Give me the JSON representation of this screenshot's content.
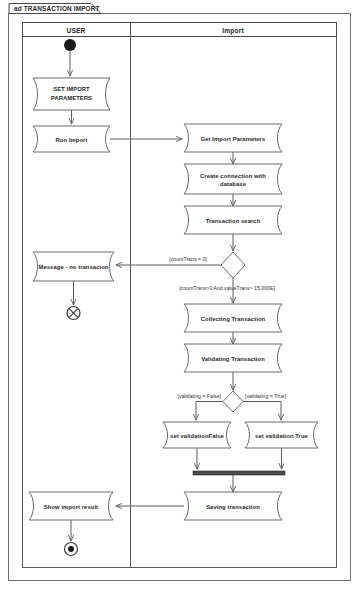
{
  "frame": {
    "title": "ad TRANSACTION IMPORT"
  },
  "lanes": [
    {
      "id": "user",
      "title": "USER"
    },
    {
      "id": "import",
      "title": "Import"
    }
  ],
  "nodes": {
    "initial": {
      "kind": "initial-node",
      "lane": "user"
    },
    "set_import_parameters": {
      "label": "SET IMPORT PARAMETERS",
      "line1": "SET IMPORT",
      "line2": "PARAMETERS",
      "lane": "user"
    },
    "run_import": {
      "label": "Run Import",
      "lane": "user"
    },
    "get_import_parameters": {
      "label": "Get Import Parameters",
      "lane": "import"
    },
    "create_connection": {
      "label": "Create connection with database",
      "line1": "Create connection with",
      "line2": "database",
      "lane": "import"
    },
    "transaction_search": {
      "label": "Transaction search",
      "lane": "import"
    },
    "decision_count": {
      "kind": "decision-node",
      "lane": "import"
    },
    "message_no_transaction": {
      "label": "Message - no transacion",
      "lane": "user"
    },
    "flow_final": {
      "kind": "flow-final-node",
      "lane": "user"
    },
    "collecting_transaction": {
      "label": "Collecting Transaction",
      "lane": "import"
    },
    "validating_transaction": {
      "label": "Validating Transaction",
      "lane": "import"
    },
    "decision_validating": {
      "kind": "decision-node",
      "lane": "import"
    },
    "set_validation_false": {
      "label": "set validationFalse",
      "lane": "import"
    },
    "set_validation_true": {
      "label": "set validation True",
      "lane": "import"
    },
    "merge_bar": {
      "kind": "join-node",
      "lane": "import"
    },
    "saving_transaction": {
      "label": "Saving transaction",
      "lane": "import"
    },
    "show_import_result": {
      "label": "Show import result",
      "lane": "user"
    },
    "final": {
      "kind": "activity-final-node",
      "lane": "user"
    }
  },
  "guards": {
    "count_zero": "[countTrans = 0]",
    "count_positive": "[countTrans>0 And valueTrans> 15.000E]",
    "validating_false": "[validating = False]",
    "validating_true": "[validating = True]"
  },
  "colors": {
    "background": "#ffffff",
    "line": "#5d5d5d",
    "text": "#262626",
    "node_fill": "#1a1a1a",
    "join_bar": "#4a4a4a"
  }
}
